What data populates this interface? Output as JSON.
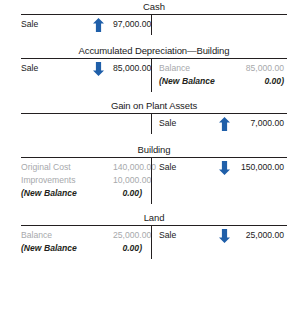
{
  "figure": {
    "type": "t-accounts",
    "accent_color": "#1f5fa9",
    "muted_color": "#a7a9ac",
    "rule_color": "#231f20"
  },
  "accounts": [
    {
      "title": "Cash",
      "left": [
        {
          "label": "Sale",
          "arrow": "up",
          "amount": "97,000.00",
          "style": "normal"
        }
      ],
      "right": []
    },
    {
      "title": "Accumulated Depreciation—Building",
      "left": [
        {
          "label": "Sale",
          "arrow": "down",
          "amount": "85,000.00",
          "style": "normal"
        }
      ],
      "right": [
        {
          "label": "Balance",
          "arrow": "none",
          "amount": "85,000.00",
          "style": "muted"
        },
        {
          "label": "(New Balance",
          "arrow": "none",
          "amount": "0.00)",
          "style": "newbal"
        }
      ]
    },
    {
      "title": "Gain on Plant Assets",
      "left": [],
      "right": [
        {
          "label": "Sale",
          "arrow": "up",
          "amount": "7,000.00",
          "style": "normal"
        }
      ]
    },
    {
      "title": "Building",
      "left": [
        {
          "label": "Original Cost",
          "arrow": "none",
          "amount": "140,000.00",
          "style": "muted"
        },
        {
          "label": "Improvements",
          "arrow": "none",
          "amount": "10,000.00",
          "style": "muted"
        },
        {
          "label": "(New Balance",
          "arrow": "none",
          "amount": "0.00)",
          "style": "newbal"
        }
      ],
      "right": [
        {
          "label": "Sale",
          "arrow": "down",
          "amount": "150,000.00",
          "style": "normal"
        }
      ]
    },
    {
      "title": "Land",
      "left": [
        {
          "label": "Balance",
          "arrow": "none",
          "amount": "25,000.00",
          "style": "muted"
        },
        {
          "label": "(New Balance",
          "arrow": "none",
          "amount": "0.00)",
          "style": "newbal"
        }
      ],
      "right": [
        {
          "label": "Sale",
          "arrow": "down",
          "amount": "25,000.00",
          "style": "normal"
        }
      ]
    }
  ]
}
